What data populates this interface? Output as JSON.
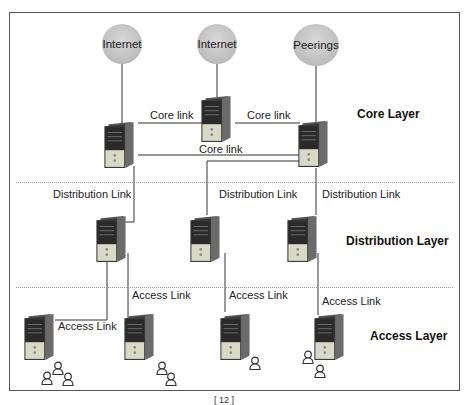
{
  "diagram": {
    "layers": {
      "core": "Core Layer",
      "distribution": "Distribution Layer",
      "access": "Access Layer"
    },
    "clouds": [
      {
        "id": "internet-1",
        "label": "Internet"
      },
      {
        "id": "internet-2",
        "label": "Internet"
      },
      {
        "id": "peerings",
        "label": "Peerings"
      }
    ],
    "links": {
      "core_left": "Core link",
      "core_right": "Core link",
      "core_bottom": "Core link",
      "dist_left": "Distribution Link",
      "dist_mid": "Distribution Link",
      "dist_right": "Distribution Link",
      "access_1": "Access Link",
      "access_2": "Access Link",
      "access_3": "Access Link",
      "access_4": "Access Link"
    },
    "nodes": {
      "core": [
        "core-server-left",
        "core-server-center",
        "core-server-right"
      ],
      "distribution": [
        "dist-server-left",
        "dist-server-mid",
        "dist-server-right"
      ],
      "access": [
        "access-server-1",
        "access-server-2",
        "access-server-3",
        "access-server-4"
      ]
    },
    "users_per_access": [
      3,
      2,
      1,
      2
    ],
    "caption": "[ 12 ]"
  }
}
